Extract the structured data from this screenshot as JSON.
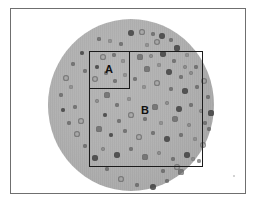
{
  "figure": {
    "type": "micrograph",
    "frame": {
      "border_color": "#6f6f6f",
      "background_color": "#ffffff"
    },
    "field": {
      "name": "field-of-view-circle",
      "shape": "circle",
      "fill_color": "#b1b1b1",
      "center_x": 120,
      "center_y": 96,
      "diameter": 166
    },
    "regions": [
      {
        "id": "A",
        "label": "A",
        "name": "counting-region-a",
        "shape": "square",
        "x": 78,
        "y": 42,
        "width": 41,
        "height": 38,
        "stroke_color": "#1b1b1b"
      },
      {
        "id": "B",
        "label": "B",
        "name": "counting-region-b",
        "shape": "square",
        "x": 78,
        "y": 42,
        "width": 114,
        "height": 116,
        "stroke_color": "#1b1b1b"
      }
    ],
    "cell_appearance": {
      "fill_color": "#565656",
      "dark_fill_color": "#3c3c3c",
      "light_fill_color": "#787878",
      "ring_stroke_color": "#5f5f5f"
    },
    "cells": [
      {
        "x": 120,
        "y": 24,
        "r": 3.0,
        "style": "dark"
      },
      {
        "x": 131,
        "y": 23,
        "r": 2.6,
        "style": "ring"
      },
      {
        "x": 142,
        "y": 25,
        "r": 2.2,
        "style": "mid"
      },
      {
        "x": 151,
        "y": 27,
        "r": 3.2,
        "style": "dark"
      },
      {
        "x": 160,
        "y": 31,
        "r": 2.4,
        "style": "mid"
      },
      {
        "x": 146,
        "y": 33,
        "r": 2.8,
        "style": "ring"
      },
      {
        "x": 136,
        "y": 36,
        "r": 2.0,
        "style": "light"
      },
      {
        "x": 110,
        "y": 35,
        "r": 2.4,
        "style": "mid"
      },
      {
        "x": 99,
        "y": 32,
        "r": 2.2,
        "style": "light"
      },
      {
        "x": 88,
        "y": 30,
        "r": 1.8,
        "style": "mid"
      },
      {
        "x": 71,
        "y": 44,
        "r": 2.0,
        "style": "dark"
      },
      {
        "x": 62,
        "y": 55,
        "r": 2.2,
        "style": "mid"
      },
      {
        "x": 55,
        "y": 69,
        "r": 2.6,
        "style": "ring"
      },
      {
        "x": 50,
        "y": 86,
        "r": 2.0,
        "style": "mid"
      },
      {
        "x": 52,
        "y": 101,
        "r": 2.4,
        "style": "dark"
      },
      {
        "x": 58,
        "y": 114,
        "r": 2.2,
        "style": "mid"
      },
      {
        "x": 66,
        "y": 125,
        "r": 2.6,
        "style": "ring"
      },
      {
        "x": 74,
        "y": 137,
        "r": 2.2,
        "style": "mid"
      },
      {
        "x": 84,
        "y": 149,
        "r": 2.8,
        "style": "dark"
      },
      {
        "x": 96,
        "y": 160,
        "r": 2.4,
        "style": "mid"
      },
      {
        "x": 110,
        "y": 170,
        "r": 2.6,
        "style": "ring"
      },
      {
        "x": 126,
        "y": 176,
        "r": 2.2,
        "style": "mid"
      },
      {
        "x": 142,
        "y": 178,
        "r": 3.0,
        "style": "dark"
      },
      {
        "x": 138,
        "y": 186,
        "r": 2.4,
        "style": "ring"
      },
      {
        "x": 156,
        "y": 172,
        "r": 2.2,
        "style": "mid"
      },
      {
        "x": 170,
        "y": 163,
        "r": 2.6,
        "style": "mid"
      },
      {
        "x": 182,
        "y": 150,
        "r": 2.4,
        "style": "light"
      },
      {
        "x": 192,
        "y": 136,
        "r": 2.8,
        "style": "ring"
      },
      {
        "x": 198,
        "y": 120,
        "r": 2.2,
        "style": "mid"
      },
      {
        "x": 200,
        "y": 104,
        "r": 2.6,
        "style": "dark"
      },
      {
        "x": 197,
        "y": 88,
        "r": 2.2,
        "style": "mid"
      },
      {
        "x": 193,
        "y": 72,
        "r": 2.8,
        "style": "ring"
      },
      {
        "x": 185,
        "y": 58,
        "r": 2.4,
        "style": "mid"
      },
      {
        "x": 176,
        "y": 46,
        "r": 2.2,
        "style": "light"
      },
      {
        "x": 166,
        "y": 39,
        "r": 2.6,
        "style": "dark"
      },
      {
        "x": 92,
        "y": 48,
        "r": 2.6,
        "style": "ring"
      },
      {
        "x": 103,
        "y": 46,
        "r": 2.2,
        "style": "mid"
      },
      {
        "x": 112,
        "y": 52,
        "r": 1.8,
        "style": "light"
      },
      {
        "x": 86,
        "y": 58,
        "r": 2.4,
        "style": "dark"
      },
      {
        "x": 95,
        "y": 64,
        "r": 2.0,
        "style": "mid"
      },
      {
        "x": 84,
        "y": 70,
        "r": 2.8,
        "style": "ring"
      },
      {
        "x": 104,
        "y": 72,
        "r": 2.2,
        "style": "mid"
      },
      {
        "x": 114,
        "y": 66,
        "r": 2.0,
        "style": "light"
      },
      {
        "x": 129,
        "y": 48,
        "r": 2.6,
        "style": "mid"
      },
      {
        "x": 140,
        "y": 47,
        "r": 2.2,
        "style": "ring"
      },
      {
        "x": 152,
        "y": 45,
        "r": 2.8,
        "style": "dark"
      },
      {
        "x": 163,
        "y": 52,
        "r": 2.4,
        "style": "mid"
      },
      {
        "x": 174,
        "y": 58,
        "r": 2.2,
        "style": "ring"
      },
      {
        "x": 148,
        "y": 56,
        "r": 2.0,
        "style": "light"
      },
      {
        "x": 136,
        "y": 60,
        "r": 2.6,
        "style": "mid"
      },
      {
        "x": 158,
        "y": 63,
        "r": 3.0,
        "style": "dark"
      },
      {
        "x": 170,
        "y": 68,
        "r": 2.4,
        "style": "mid"
      },
      {
        "x": 180,
        "y": 64,
        "r": 2.2,
        "style": "ring"
      },
      {
        "x": 124,
        "y": 70,
        "r": 2.4,
        "style": "mid"
      },
      {
        "x": 133,
        "y": 78,
        "r": 2.0,
        "style": "light"
      },
      {
        "x": 146,
        "y": 74,
        "r": 2.6,
        "style": "ring"
      },
      {
        "x": 160,
        "y": 80,
        "r": 2.2,
        "style": "mid"
      },
      {
        "x": 174,
        "y": 82,
        "r": 2.8,
        "style": "dark"
      },
      {
        "x": 186,
        "y": 78,
        "r": 2.0,
        "style": "mid"
      },
      {
        "x": 96,
        "y": 86,
        "r": 2.6,
        "style": "mid"
      },
      {
        "x": 86,
        "y": 92,
        "r": 2.2,
        "style": "ring"
      },
      {
        "x": 106,
        "y": 96,
        "r": 2.4,
        "style": "mid"
      },
      {
        "x": 118,
        "y": 90,
        "r": 2.0,
        "style": "light"
      },
      {
        "x": 144,
        "y": 98,
        "r": 2.6,
        "style": "mid"
      },
      {
        "x": 156,
        "y": 94,
        "r": 2.2,
        "style": "ring"
      },
      {
        "x": 168,
        "y": 100,
        "r": 3.0,
        "style": "dark"
      },
      {
        "x": 180,
        "y": 96,
        "r": 2.4,
        "style": "mid"
      },
      {
        "x": 190,
        "y": 102,
        "r": 2.2,
        "style": "ring"
      },
      {
        "x": 94,
        "y": 106,
        "r": 2.4,
        "style": "dark"
      },
      {
        "x": 108,
        "y": 112,
        "r": 2.0,
        "style": "mid"
      },
      {
        "x": 120,
        "y": 106,
        "r": 2.6,
        "style": "ring"
      },
      {
        "x": 134,
        "y": 110,
        "r": 2.2,
        "style": "mid"
      },
      {
        "x": 150,
        "y": 114,
        "r": 2.4,
        "style": "light"
      },
      {
        "x": 164,
        "y": 110,
        "r": 2.8,
        "style": "mid"
      },
      {
        "x": 178,
        "y": 116,
        "r": 2.2,
        "style": "ring"
      },
      {
        "x": 88,
        "y": 120,
        "r": 2.6,
        "style": "mid"
      },
      {
        "x": 100,
        "y": 126,
        "r": 2.2,
        "style": "dark"
      },
      {
        "x": 114,
        "y": 122,
        "r": 2.0,
        "style": "mid"
      },
      {
        "x": 128,
        "y": 128,
        "r": 2.6,
        "style": "ring"
      },
      {
        "x": 142,
        "y": 124,
        "r": 2.2,
        "style": "mid"
      },
      {
        "x": 156,
        "y": 130,
        "r": 3.0,
        "style": "dark"
      },
      {
        "x": 170,
        "y": 126,
        "r": 2.4,
        "style": "mid"
      },
      {
        "x": 184,
        "y": 130,
        "r": 2.2,
        "style": "light"
      },
      {
        "x": 92,
        "y": 140,
        "r": 2.4,
        "style": "ring"
      },
      {
        "x": 106,
        "y": 146,
        "r": 2.8,
        "style": "dark"
      },
      {
        "x": 120,
        "y": 140,
        "r": 2.0,
        "style": "mid"
      },
      {
        "x": 134,
        "y": 148,
        "r": 2.6,
        "style": "mid"
      },
      {
        "x": 148,
        "y": 144,
        "r": 2.2,
        "style": "ring"
      },
      {
        "x": 162,
        "y": 150,
        "r": 2.4,
        "style": "mid"
      },
      {
        "x": 176,
        "y": 146,
        "r": 2.8,
        "style": "dark"
      },
      {
        "x": 188,
        "y": 152,
        "r": 2.2,
        "style": "mid"
      },
      {
        "x": 166,
        "y": 158,
        "r": 2.6,
        "style": "ring"
      },
      {
        "x": 152,
        "y": 162,
        "r": 2.2,
        "style": "mid"
      },
      {
        "x": 64,
        "y": 98,
        "r": 2.2,
        "style": "mid"
      },
      {
        "x": 70,
        "y": 112,
        "r": 2.6,
        "style": "ring"
      },
      {
        "x": 60,
        "y": 78,
        "r": 2.0,
        "style": "light"
      },
      {
        "x": 74,
        "y": 62,
        "r": 2.4,
        "style": "mid"
      },
      {
        "x": 194,
        "y": 114,
        "r": 2.0,
        "style": "mid"
      }
    ]
  }
}
